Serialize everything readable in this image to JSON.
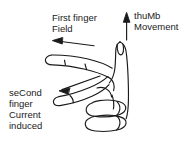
{
  "diagram": {
    "stroke_color": "#1a1a1a",
    "background_color": "#ffffff",
    "text_color": "#1a1a1a"
  },
  "labels": {
    "first_finger": {
      "line1": "First finger",
      "line2": "Field"
    },
    "thumb": {
      "line1": "thuMb",
      "line2": "Movement"
    },
    "second_finger": {
      "line1": "seCond",
      "line2": "finger",
      "line3": "Current",
      "line4": "induced"
    }
  },
  "arrows": {
    "field_arrow": "arrow-left",
    "current_arrow": "arrow-left-down",
    "movement_arrow": "arrow-up"
  }
}
